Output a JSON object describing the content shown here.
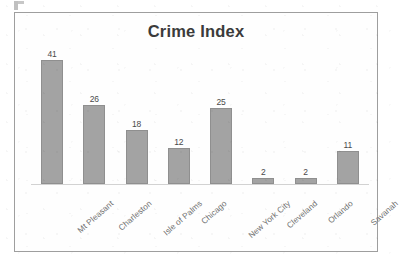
{
  "chart_data": {
    "type": "bar",
    "title": "Crime Index",
    "xlabel": "",
    "ylabel": "",
    "categories": [
      "Mt Pleasant",
      "Charleston",
      "Isle of Palms",
      "Chicago",
      "New York City",
      "Cleveland",
      "Orlando",
      "Savanah"
    ],
    "values": [
      41,
      26,
      18,
      12,
      25,
      2,
      2,
      11
    ],
    "ylim": [
      0,
      44
    ],
    "grid": false,
    "legend": false,
    "data_labels": true,
    "bar_color": "#a3a3a3",
    "bar_border_color": "#8f8f8f",
    "title_color": "#3b3b3b",
    "axis_line_color": "#d2d2d2",
    "frame_border_color": "#9e9e9e",
    "label_color": "#6e6e6e",
    "x_label_rotation": -41
  },
  "artifact": {
    "name": "scan-artifact-mark"
  }
}
